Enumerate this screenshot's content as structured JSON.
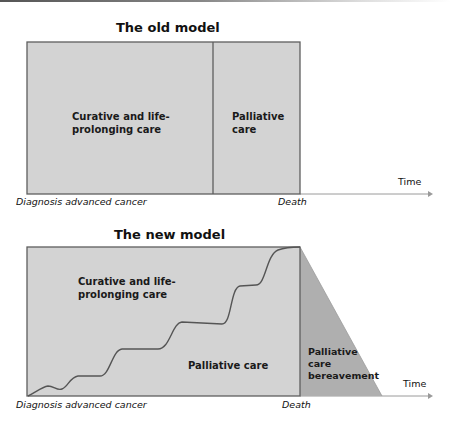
{
  "old_model": {
    "title": "The old model",
    "regions": [
      {
        "label_line1": "Curative and life-",
        "label_line2": "prolonging care"
      },
      {
        "label_line1": "Palliative",
        "label_line2": "care"
      }
    ],
    "x_start_label": "Diagnosis advanced cancer",
    "x_death_label": "Death",
    "axis_label": "Time"
  },
  "new_model": {
    "title": "The new model",
    "regions": [
      {
        "label_line1": "Curative and life-",
        "label_line2": "prolonging care"
      },
      {
        "label": "Palliative care"
      },
      {
        "label_line1": "Palliative",
        "label_line2": "care",
        "label_line3": "bereavement"
      }
    ],
    "x_start_label": "Diagnosis advanced cancer",
    "x_death_label": "Death",
    "axis_label": "Time"
  },
  "colors": {
    "box_fill": "#d3d3d3",
    "bereavement_fill": "#afafaf",
    "border": "#5e5e5e",
    "axis": "#9a9a9a"
  }
}
